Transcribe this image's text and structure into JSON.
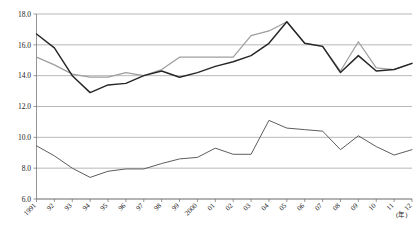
{
  "chart_data": {
    "type": "line",
    "title": "",
    "subtitle": "",
    "xlabel": "(年)",
    "ylabel": "",
    "ylim": [
      6.0,
      18.0
    ],
    "ytick_step": 2.0,
    "yticks": [
      "18.0",
      "16.0",
      "14.0",
      "12.0",
      "10.0",
      "8.0",
      "6.0"
    ],
    "ytick_values": [
      18.0,
      16.0,
      14.0,
      12.0,
      10.0,
      8.0,
      6.0
    ],
    "grid": true,
    "grid_axis": "y",
    "legend": "none",
    "legend_position": "none",
    "x_unit_label": "(年)",
    "categories": [
      "1991",
      "92",
      "93",
      "94",
      "95",
      "96",
      "97",
      "98",
      "99",
      "2000",
      "01",
      "02",
      "03",
      "04",
      "05",
      "06",
      "07",
      "08",
      "09",
      "10",
      "11",
      "12"
    ],
    "xtick_labels": [
      "1991",
      "92",
      "93",
      "94",
      "95",
      "96",
      "97",
      "98",
      "99",
      "2000",
      "01",
      "02",
      "03",
      "04",
      "05",
      "06",
      "07",
      "08",
      "09",
      "10",
      "11",
      "12"
    ],
    "series": [
      {
        "name": "series-dark-upper",
        "color": "#262626",
        "values": [
          16.7,
          15.8,
          14.0,
          12.9,
          13.4,
          13.5,
          14.0,
          14.3,
          13.9,
          14.2,
          14.6,
          14.9,
          15.3,
          16.1,
          17.5,
          16.1,
          15.9,
          14.2,
          15.3,
          14.3,
          14.4,
          14.8
        ]
      },
      {
        "name": "series-gray-upper",
        "color": "#9e9e9e",
        "values": [
          15.2,
          14.7,
          14.1,
          13.9,
          13.9,
          14.2,
          14.0,
          14.4,
          15.2,
          15.2,
          15.2,
          15.2,
          16.6,
          16.9,
          17.5,
          16.1,
          15.9,
          14.3,
          16.2,
          14.5,
          14.4,
          14.8
        ]
      },
      {
        "name": "series-lower",
        "color": "#5d5d5d",
        "values": [
          9.45,
          8.8,
          8.0,
          7.4,
          7.8,
          7.95,
          7.95,
          8.3,
          8.6,
          8.7,
          9.3,
          8.9,
          8.9,
          11.1,
          10.6,
          10.5,
          10.4,
          9.2,
          10.1,
          9.4,
          8.85,
          9.2
        ]
      }
    ],
    "annotations": []
  }
}
